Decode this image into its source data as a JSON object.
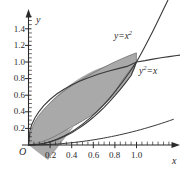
{
  "figure": {
    "background_color": "#ffffff",
    "axis_color": "#2b2b2b",
    "curve_color": "#3a3a3a",
    "fill_color": "#a9a9a9",
    "fill_stroke_color": "#555555",
    "origin_label": "O",
    "x_axis_name": "x",
    "y_axis_name": "y"
  },
  "chart_data": {
    "type": "line",
    "title": "",
    "xlabel": "x",
    "ylabel": "y",
    "xlim": [
      0,
      1.18
    ],
    "ylim": [
      0,
      1.5
    ],
    "grid": false,
    "legend": "inline-curve-labels",
    "x_ticks": [
      0.2,
      0.4,
      0.6,
      0.8,
      1.0
    ],
    "x_tick_labels": [
      "0.2",
      "0.4",
      "0.6",
      "0.8",
      "1.0"
    ],
    "y_ticks": [
      0.2,
      0.4,
      0.6,
      0.8,
      1.0,
      1.2,
      1.4
    ],
    "y_tick_labels": [
      "0.2",
      "0.4",
      "0.6",
      "0.8",
      "1.0",
      "1.2",
      "1.4"
    ],
    "x_minor_tick_step": 0.05,
    "y_minor_tick_step": 0.05,
    "series": [
      {
        "name": "y=x^2",
        "label_html": "y=x<sup>2</sup>",
        "equation": "y = x^2",
        "x": [
          0,
          0.1,
          0.2,
          0.3,
          0.4,
          0.5,
          0.6,
          0.7,
          0.8,
          0.9,
          1.0,
          1.1,
          1.18
        ],
        "values": [
          0,
          0.01,
          0.04,
          0.09,
          0.16,
          0.25,
          0.36,
          0.49,
          0.64,
          0.81,
          1.0,
          1.21,
          1.3924
        ]
      },
      {
        "name": "y^2=x",
        "label_html": "y<sup>2</sup>=x",
        "equation": "y = sqrt(x)",
        "x": [
          0,
          0.05,
          0.1,
          0.2,
          0.3,
          0.4,
          0.5,
          0.6,
          0.7,
          0.8,
          0.9,
          1.0,
          1.1,
          1.18
        ],
        "values": [
          0,
          0.2236,
          0.3162,
          0.4472,
          0.5477,
          0.6325,
          0.7071,
          0.7746,
          0.8367,
          0.8944,
          0.9487,
          1.0,
          1.0488,
          1.0863
        ]
      }
    ],
    "shaded_region": {
      "description": "Region bounded above by y^2=x and below by y=x^2 between the intersections",
      "upper_curve": "y^2=x",
      "lower_curve": "y=x^2",
      "x_range": [
        0,
        1
      ],
      "intersections": [
        [
          0,
          0
        ],
        [
          1,
          1
        ]
      ]
    },
    "annotations": [
      {
        "text": "y=x^2",
        "x": 0.72,
        "y": 1.25
      },
      {
        "text": "y^2=x",
        "x": 1.07,
        "y": 0.82
      },
      {
        "text": "O",
        "x": 0.0,
        "y": 0.0
      }
    ]
  }
}
